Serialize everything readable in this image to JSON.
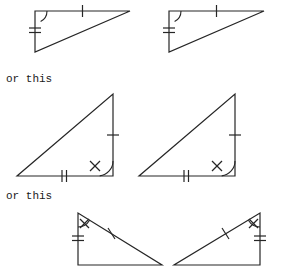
{
  "figure": {
    "type": "geometry-diagram",
    "background_color": "#ffffff",
    "stroke_color": "#262626",
    "stroke_width": 1.2,
    "captions": [
      {
        "id": "caption-1",
        "text": "or this",
        "x": 6,
        "y": 82
      },
      {
        "id": "caption-2",
        "text": "or this",
        "x": 6,
        "y": 199
      }
    ],
    "rows": [
      {
        "id": "row-1",
        "label": "row-one-right-angle-top-left",
        "triangles": [
          {
            "id": "triangle-1",
            "label": "triangle-top-left",
            "vertices": [
              {
                "name": "right-angle-vertex",
                "x": 35,
                "y": 11
              },
              {
                "name": "top-right-vertex",
                "x": 130,
                "y": 11
              },
              {
                "name": "bottom-vertex",
                "x": 35,
                "y": 52
              }
            ],
            "marks": [
              {
                "type": "right-angle-arc",
                "at": "right-angle-vertex",
                "from_deg": 0,
                "to_deg": 90,
                "radius": 12
              },
              {
                "type": "single-tick",
                "on_edge": "top",
                "position": 0.5
              },
              {
                "type": "double-tick",
                "on_edge": "left",
                "position": 0.45
              }
            ]
          },
          {
            "id": "triangle-2",
            "label": "triangle-top-right",
            "vertices": [
              {
                "name": "right-angle-vertex",
                "x": 169,
                "y": 11
              },
              {
                "name": "top-right-vertex",
                "x": 264,
                "y": 11
              },
              {
                "name": "bottom-vertex",
                "x": 169,
                "y": 52
              }
            ],
            "marks": [
              {
                "type": "right-angle-arc",
                "at": "right-angle-vertex",
                "from_deg": 0,
                "to_deg": 90,
                "radius": 12
              },
              {
                "type": "single-tick",
                "on_edge": "top",
                "position": 0.5
              },
              {
                "type": "double-tick",
                "on_edge": "left",
                "position": 0.45
              }
            ]
          }
        ]
      },
      {
        "id": "row-2",
        "label": "row-two-right-angle-bottom-right",
        "triangles": [
          {
            "id": "triangle-3",
            "label": "triangle-middle-left",
            "vertices": [
              {
                "name": "right-angle-vertex",
                "x": 113,
                "y": 176
              },
              {
                "name": "top-vertex",
                "x": 113,
                "y": 94
              },
              {
                "name": "bottom-left-vertex",
                "x": 17,
                "y": 176
              }
            ],
            "marks": [
              {
                "type": "right-angle-arc",
                "at": "right-angle-vertex",
                "radius": 15
              },
              {
                "type": "x-mark",
                "at": "right-angle-vertex",
                "inset": 22
              },
              {
                "type": "single-tick",
                "on_edge": "right",
                "position": 0.5
              },
              {
                "type": "double-tick",
                "on_edge": "bottom",
                "position": 0.62
              }
            ]
          },
          {
            "id": "triangle-4",
            "label": "triangle-middle-right",
            "vertices": [
              {
                "name": "right-angle-vertex",
                "x": 235,
                "y": 176
              },
              {
                "name": "top-vertex",
                "x": 235,
                "y": 94
              },
              {
                "name": "bottom-left-vertex",
                "x": 139,
                "y": 176
              }
            ],
            "marks": [
              {
                "type": "right-angle-arc",
                "at": "right-angle-vertex",
                "radius": 15
              },
              {
                "type": "x-mark",
                "at": "right-angle-vertex",
                "inset": 22
              },
              {
                "type": "single-tick",
                "on_edge": "right",
                "position": 0.5
              },
              {
                "type": "double-tick",
                "on_edge": "bottom",
                "position": 0.62
              }
            ]
          }
        ]
      },
      {
        "id": "row-3",
        "label": "row-three-mirrored-pair",
        "triangles": [
          {
            "id": "triangle-5",
            "label": "triangle-bottom-left",
            "vertices": [
              {
                "name": "right-angle-vertex",
                "x": 78,
                "y": 265
              },
              {
                "name": "top-vertex",
                "x": 78,
                "y": 213
              },
              {
                "name": "far-vertex",
                "x": 162,
                "y": 265
              }
            ],
            "marks": [
              {
                "type": "x-mark",
                "at": "top-vertex"
              },
              {
                "type": "angle-arc",
                "at": "top-vertex"
              },
              {
                "type": "double-tick",
                "on_edge": "left",
                "position": 0.5
              },
              {
                "type": "single-tick",
                "on_edge": "hypotenuse",
                "position": 0.4
              }
            ]
          },
          {
            "id": "triangle-6",
            "label": "triangle-bottom-right",
            "vertices": [
              {
                "name": "right-angle-vertex",
                "x": 260,
                "y": 265
              },
              {
                "name": "top-vertex",
                "x": 260,
                "y": 213
              },
              {
                "name": "far-vertex",
                "x": 174,
                "y": 265
              }
            ],
            "marks": [
              {
                "type": "x-mark",
                "at": "top-vertex"
              },
              {
                "type": "angle-arc",
                "at": "top-vertex"
              },
              {
                "type": "double-tick",
                "on_edge": "right",
                "position": 0.5
              },
              {
                "type": "single-tick",
                "on_edge": "hypotenuse",
                "position": 0.4
              }
            ]
          }
        ]
      }
    ]
  }
}
